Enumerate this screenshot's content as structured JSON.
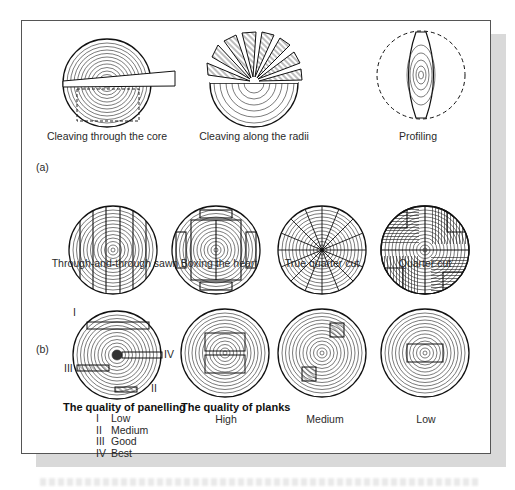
{
  "figure": {
    "section_a": {
      "marker": "(a)",
      "methods": [
        {
          "id": "cleaving-core",
          "label": "Cleaving through the core"
        },
        {
          "id": "cleaving-radii",
          "label": "Cleaving along the radii"
        },
        {
          "id": "profiling",
          "label": "Profiling"
        },
        {
          "id": "through-sawn",
          "label": "Through-and-through sawn"
        },
        {
          "id": "boxing-heart",
          "label": "Boxing the heart"
        },
        {
          "id": "true-quarter",
          "label": "True quarter cut"
        },
        {
          "id": "quarter-cut",
          "label": "Quarter cut"
        }
      ]
    },
    "section_b": {
      "marker": "(b)",
      "panelling": {
        "title": "The quality of panelling",
        "callouts": [
          "I",
          "II",
          "III",
          "IV"
        ],
        "legend": [
          {
            "num": "I",
            "text": "Low"
          },
          {
            "num": "II",
            "text": "Medium"
          },
          {
            "num": "III",
            "text": "Good"
          },
          {
            "num": "IV",
            "text": "Best"
          }
        ]
      },
      "planks": {
        "title": "The quality of planks",
        "grades": [
          "High",
          "Medium",
          "Low"
        ]
      }
    }
  },
  "colors": {
    "ink": "#1a1a1a",
    "frame": "#555555",
    "shadow": "#d9d9d9",
    "background": "#ffffff"
  }
}
